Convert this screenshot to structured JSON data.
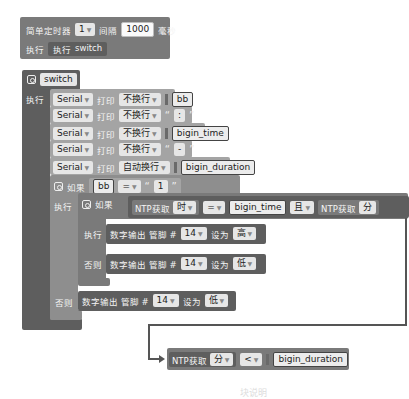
{
  "timer_block": {
    "label": "简单定时器",
    "timer_id": "1",
    "interval_label": "间隔",
    "interval_value": "1000",
    "unit_label": "毫秒",
    "do_label": "执行",
    "do_call_label": "执行",
    "do_call_name": "switch"
  },
  "function_block": {
    "name": "switch",
    "do_label": "执行",
    "serial_rows": [
      {
        "port": "Serial",
        "print_label": "打印",
        "mode": "不换行",
        "value": "bb",
        "kind": "var"
      },
      {
        "port": "Serial",
        "print_label": "打印",
        "mode": "不换行",
        "value": ":",
        "kind": "text"
      },
      {
        "port": "Serial",
        "print_label": "打印",
        "mode": "不换行",
        "value": "bigin_time",
        "kind": "var"
      },
      {
        "port": "Serial",
        "print_label": "打印",
        "mode": "不换行",
        "value": "-",
        "kind": "text"
      },
      {
        "port": "Serial",
        "print_label": "打印",
        "mode": "自动换行",
        "value": "bigin_duration",
        "kind": "var"
      }
    ],
    "outer_if": {
      "if_label": "如果",
      "left": "bb",
      "op": "=",
      "right": "1",
      "do_label": "执行",
      "else_label": "否则",
      "else_action": {
        "label": "数字输出 管脚 #",
        "pin": "14",
        "set_label": "设为",
        "value": "低"
      }
    },
    "inner_if": {
      "if_label": "如果",
      "ntp_label": "NTP获取",
      "ntp_unit": "时",
      "op": "=",
      "right": "bigin_time",
      "and_label": "且",
      "ntp_label2": "NTP获取",
      "ntp_unit2": "分",
      "do_label": "执行",
      "else_label": "否则",
      "then_action": {
        "label": "数字输出 管脚 #",
        "pin": "14",
        "set_label": "设为",
        "value": "高"
      },
      "else_action": {
        "label": "数字输出 管脚 #",
        "pin": "14",
        "set_label": "设为",
        "value": "低"
      }
    }
  },
  "continuation_block": {
    "ntp_label": "NTP获取",
    "unit": "分",
    "op": "<",
    "value": "bigin_duration"
  },
  "caption": "块说明"
}
